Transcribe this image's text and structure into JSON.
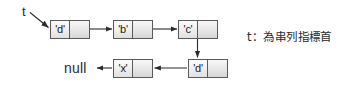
{
  "diagram": {
    "pointer_label": "t",
    "null_label": "null",
    "caption": "t：為串列指標首",
    "colors": {
      "box_border": "#5a5a5a",
      "box_fill_light": "#fbfbfb",
      "box_fill_dark": "#dcdcdc",
      "arrow": "#2b2b2b",
      "text": "#1a1a1a",
      "background": "#ffffff"
    },
    "nodes": [
      {
        "id": "node-d-1",
        "value": "'d'",
        "row": "top",
        "order": 1
      },
      {
        "id": "node-b",
        "value": "'b'",
        "row": "top",
        "order": 2
      },
      {
        "id": "node-c",
        "value": "'c'",
        "row": "top",
        "order": 3
      },
      {
        "id": "node-d-2",
        "value": "'d'",
        "row": "bottom",
        "order": 4
      },
      {
        "id": "node-x",
        "value": "'x'",
        "row": "bottom",
        "order": 5
      }
    ],
    "links": [
      {
        "from": "t",
        "to": "node-d-1",
        "direction": "diagonal-down-right"
      },
      {
        "from": "node-d-1",
        "to": "node-b",
        "direction": "right"
      },
      {
        "from": "node-b",
        "to": "node-c",
        "direction": "right"
      },
      {
        "from": "node-c",
        "to": "node-d-2",
        "direction": "down"
      },
      {
        "from": "node-d-2",
        "to": "node-x",
        "direction": "left"
      },
      {
        "from": "node-x",
        "to": "null",
        "direction": "left"
      }
    ]
  }
}
